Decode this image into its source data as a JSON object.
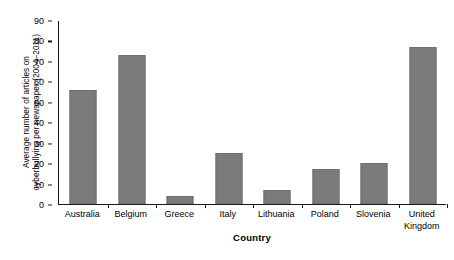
{
  "chart_data": {
    "type": "bar",
    "title": "",
    "subtitle": "",
    "xlabel": "Country",
    "ylabel_line1": "Average number of articles on",
    "ylabel_line2": "cyberbullying per newspaper (2004–2011)",
    "categories": [
      "Australia",
      "Belgium",
      "Greece",
      "Italy",
      "Lithuania",
      "Poland",
      "Slovenia",
      "United Kingdom"
    ],
    "category_lines": [
      [
        "Australia"
      ],
      [
        "Belgium"
      ],
      [
        "Greece"
      ],
      [
        "Italy"
      ],
      [
        "Lithuania"
      ],
      [
        "Poland"
      ],
      [
        "Slovenia"
      ],
      [
        "United",
        "Kingdom"
      ]
    ],
    "values": [
      56,
      73,
      4,
      25,
      7,
      17,
      20,
      77
    ],
    "ylim": [
      0,
      90
    ],
    "ytick_values": [
      0,
      10,
      20,
      30,
      40,
      50,
      60,
      70,
      80,
      90
    ],
    "ytick_labels": [
      "0",
      "10",
      "20",
      "30",
      "40",
      "50",
      "60",
      "70",
      "80",
      "90"
    ],
    "grid": false,
    "legend": false,
    "legend_position": "none",
    "bar_color": "#7b7b7b",
    "axis_color": "#1a1a1a",
    "background_color": "#ffffff"
  }
}
